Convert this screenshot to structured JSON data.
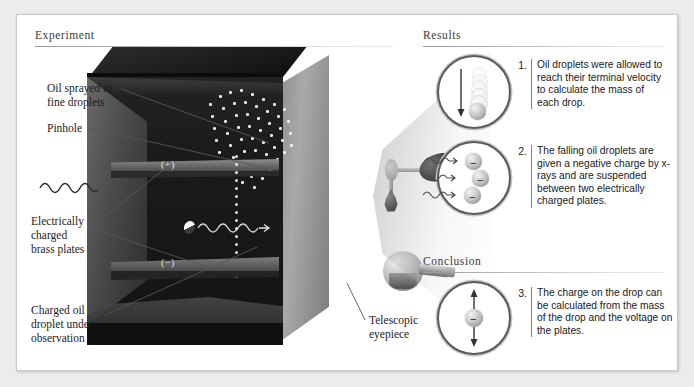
{
  "figure": {
    "title_experiment": "Experiment",
    "title_results": "Results",
    "title_conclusion": "Conclusion"
  },
  "experiment": {
    "callouts": [
      {
        "id": "oil-sprayed",
        "text": "Oil sprayed in\nfine droplets"
      },
      {
        "id": "pinhole",
        "text": "Pinhole"
      },
      {
        "id": "brass-plates",
        "text": "Electrically\ncharged\nbrass plates"
      },
      {
        "id": "charged-droplet",
        "text": "Charged oil\ndroplet under\nobservation"
      },
      {
        "id": "telescopic-eyepiece",
        "text": "Telescopic\neyepiece"
      }
    ],
    "callout_lines": {
      "oil_sprayed_line1": "Oil sprayed in",
      "oil_sprayed_line2": "fine droplets",
      "pinhole_line1": "Pinhole",
      "brass_line1": "Electrically",
      "brass_line2": "charged",
      "brass_line3": "brass plates",
      "droplet_line1": "Charged oil",
      "droplet_line2": "droplet under",
      "droplet_line3": "observation",
      "eyepiece_line1": "Telescopic",
      "eyepiece_line2": "eyepiece"
    },
    "plate_labels": {
      "positive": "(+)",
      "negative": "(−)"
    }
  },
  "results": {
    "items": [
      {
        "number": "1.",
        "text": "Oil droplets were allowed to reach their terminal velocity to calculate the mass of each drop.",
        "inset": {
          "name": "falling-droplet-inset",
          "arrow_direction": "down",
          "droplet_count": 7,
          "charge_symbol": ""
        }
      },
      {
        "number": "2.",
        "text": "The falling oil droplets are given a negative charge by x-rays and are suspended between two electrically charged plates.",
        "inset": {
          "name": "charged-droplets-inset",
          "arrow_direction": "right",
          "droplet_count": 3,
          "charge_symbol": "−"
        }
      }
    ]
  },
  "conclusion": {
    "items": [
      {
        "number": "3.",
        "text": "The charge on the drop can be calculated from the mass of the drop and the voltage on the plates.",
        "inset": {
          "name": "suspended-droplet-inset",
          "arrow_direction": "up-down",
          "droplet_count": 1,
          "charge_symbol": "−"
        }
      }
    ]
  },
  "colors": {
    "page_background": "#ececec",
    "card_background": "#ffffff",
    "frame_border": "#c8c8c8",
    "heading_text": "#3a3a3a",
    "body_text": "#1a1a1a",
    "leader_line": "#55575a",
    "apparatus_dark": "#141414",
    "apparatus_metal": "#8f8f8f",
    "droplet_white": "#f2f2f2"
  }
}
